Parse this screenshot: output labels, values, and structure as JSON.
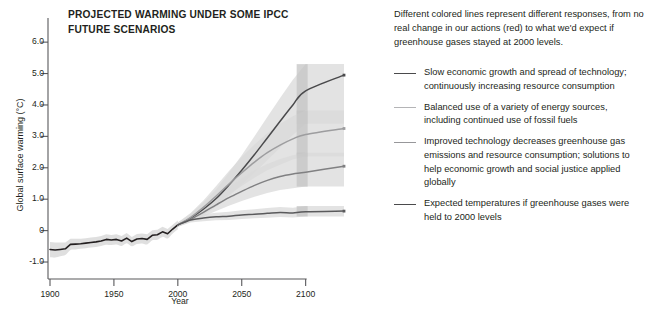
{
  "chart_data": {
    "type": "line",
    "title": "PROJECTED WARMING UNDER SOME IPCC FUTURE SCENARIOS",
    "title_line1": "PROJECTED WARMING UNDER SOME IPCC",
    "title_line2": "FUTURE SCENARIOS",
    "xlabel": "Year",
    "ylabel": "Global surface warming (°C)",
    "xlim": [
      1900,
      2130
    ],
    "ylim": [
      -1.35,
      6.45
    ],
    "grid": false,
    "legend_position": "right-panel",
    "xticks": [
      1900,
      1950,
      2000,
      2050,
      2100
    ],
    "xtick_labels": [
      "1900",
      "1950",
      "2000",
      "2050",
      "2100"
    ],
    "yticks": [
      -1.0,
      0,
      1.0,
      2.0,
      3.0,
      4.0,
      5.0,
      6.0
    ],
    "ytick_labels": [
      "-1.0",
      "0",
      "1.0",
      "2.0",
      "3.0",
      "4.0",
      "5.0",
      "6.0"
    ],
    "band_end_year": 2100,
    "series": [
      {
        "name": "historical",
        "label": "20th century observations",
        "color": "#231f20",
        "width": 1.6,
        "x": [
          1900,
          1904,
          1908,
          1912,
          1916,
          1920,
          1924,
          1928,
          1932,
          1936,
          1940,
          1944,
          1948,
          1952,
          1956,
          1960,
          1964,
          1968,
          1972,
          1976,
          1980,
          1984,
          1988,
          1992,
          1996,
          2000
        ],
        "values": [
          -0.6,
          -0.62,
          -0.6,
          -0.58,
          -0.44,
          -0.43,
          -0.42,
          -0.4,
          -0.38,
          -0.36,
          -0.33,
          -0.28,
          -0.3,
          -0.28,
          -0.33,
          -0.24,
          -0.35,
          -0.27,
          -0.25,
          -0.28,
          -0.15,
          -0.13,
          -0.04,
          -0.1,
          0.05,
          0.18
        ],
        "band_lo": [
          -0.85,
          -0.86,
          -0.82,
          -0.78,
          -0.62,
          -0.6,
          -0.58,
          -0.56,
          -0.54,
          -0.52,
          -0.49,
          -0.45,
          -0.46,
          -0.44,
          -0.49,
          -0.4,
          -0.5,
          -0.43,
          -0.41,
          -0.44,
          -0.31,
          -0.29,
          -0.2,
          -0.25,
          -0.09,
          0.04
        ],
        "band_hi": [
          -0.36,
          -0.38,
          -0.38,
          -0.38,
          -0.26,
          -0.26,
          -0.26,
          -0.24,
          -0.22,
          -0.2,
          -0.17,
          -0.12,
          -0.14,
          -0.12,
          -0.17,
          -0.08,
          -0.2,
          -0.11,
          -0.09,
          -0.12,
          0.01,
          0.03,
          0.12,
          0.05,
          0.19,
          0.32
        ]
      },
      {
        "name": "a2-slow-growth",
        "label": "Slow economic growth and spread of technology; continuously increasing resource consumption",
        "color": "#4a4a4c",
        "width": 1.5,
        "x": [
          2000,
          2010,
          2020,
          2030,
          2040,
          2050,
          2060,
          2070,
          2080,
          2090,
          2100,
          2130
        ],
        "values": [
          0.18,
          0.4,
          0.68,
          1.02,
          1.45,
          1.92,
          2.42,
          2.95,
          3.48,
          4.0,
          4.45,
          4.95
        ],
        "band_lo": [
          0.12,
          0.3,
          0.5,
          0.76,
          1.1,
          1.46,
          1.84,
          2.24,
          2.64,
          3.04,
          3.4,
          3.4
        ],
        "band_hi": [
          0.26,
          0.54,
          0.9,
          1.32,
          1.84,
          2.4,
          3.0,
          3.62,
          4.22,
          4.8,
          5.3,
          5.3
        ],
        "end_value": 4.95
      },
      {
        "name": "a1b-balanced",
        "label": "Balanced use of a variety of energy sources, including continued use of fossil fuels",
        "color": "#9d9d9f",
        "width": 1.5,
        "x": [
          2000,
          2010,
          2020,
          2030,
          2040,
          2050,
          2060,
          2070,
          2080,
          2090,
          2100,
          2130
        ],
        "values": [
          0.18,
          0.42,
          0.74,
          1.1,
          1.48,
          1.84,
          2.18,
          2.48,
          2.72,
          2.92,
          3.06,
          3.25
        ],
        "band_lo": [
          0.12,
          0.32,
          0.56,
          0.84,
          1.14,
          1.42,
          1.68,
          1.92,
          2.1,
          2.26,
          2.36,
          2.36
        ],
        "band_hi": [
          0.26,
          0.56,
          0.96,
          1.42,
          1.9,
          2.34,
          2.74,
          3.1,
          3.4,
          3.64,
          3.82,
          3.82
        ],
        "end_value": 3.25
      },
      {
        "name": "b1-improved-tech",
        "label": "Improved technology decreases greenhouse gas emissions and resource consumption; solutions to help economic growth and social justice applied globally",
        "color": "#808082",
        "width": 1.5,
        "x": [
          2000,
          2010,
          2020,
          2030,
          2040,
          2050,
          2060,
          2070,
          2080,
          2090,
          2100,
          2130
        ],
        "values": [
          0.18,
          0.36,
          0.58,
          0.82,
          1.05,
          1.25,
          1.44,
          1.6,
          1.72,
          1.8,
          1.86,
          2.05
        ],
        "band_lo": [
          0.12,
          0.28,
          0.44,
          0.62,
          0.79,
          0.94,
          1.08,
          1.2,
          1.29,
          1.35,
          1.4,
          1.4
        ],
        "band_hi": [
          0.26,
          0.48,
          0.76,
          1.08,
          1.38,
          1.66,
          1.92,
          2.12,
          2.28,
          2.4,
          2.48,
          2.48
        ],
        "end_value": 2.05
      },
      {
        "name": "constant-2000",
        "label": "Expected temperatures if greenhouse gases were held to 2000 levels",
        "color": "#5a5a5c",
        "width": 1.5,
        "x": [
          2000,
          2010,
          2020,
          2030,
          2040,
          2050,
          2060,
          2070,
          2080,
          2090,
          2100,
          2130
        ],
        "values": [
          0.18,
          0.34,
          0.4,
          0.44,
          0.46,
          0.5,
          0.52,
          0.55,
          0.58,
          0.56,
          0.6,
          0.62
        ],
        "band_lo": [
          0.12,
          0.26,
          0.3,
          0.33,
          0.34,
          0.37,
          0.39,
          0.41,
          0.43,
          0.42,
          0.45,
          0.45
        ],
        "band_hi": [
          0.26,
          0.44,
          0.52,
          0.57,
          0.6,
          0.65,
          0.68,
          0.72,
          0.75,
          0.73,
          0.78,
          0.78
        ],
        "end_value": 0.62
      }
    ]
  },
  "panel": {
    "intro": "Different colored lines represent different responses, from no real change in our actions (red) to what we'd expect if greenhouse gases stayed at 2000 levels.",
    "legend": [
      {
        "swatch_color": "#4a4a4c",
        "text": "Slow economic growth and spread of technology; continuously increasing resource consumption"
      },
      {
        "swatch_color": "#b4b4b6",
        "text": "Balanced use of a variety of energy sources, including continued use of fossil fuels"
      },
      {
        "swatch_color": "#97979a",
        "text": "Improved technology decreases greenhouse gas emissions and resource consumption; solutions to help economic growth and social justice applied globally"
      },
      {
        "swatch_color": "#4a4a4c",
        "text": "Expected temperatures if greenhouse gases were held to 2000 levels"
      }
    ]
  },
  "colors": {
    "axis": "#58585b",
    "text": "#231f20",
    "band_outer": "#d9d9d9",
    "band_inner": "#c4c4c4",
    "background": "#ffffff"
  }
}
